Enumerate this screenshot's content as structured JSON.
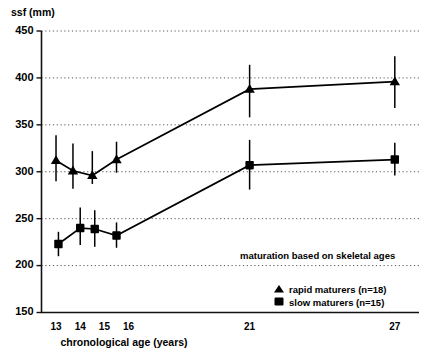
{
  "chart_data": {
    "type": "line",
    "title": "",
    "xlabel": "chronological age (years)",
    "ylabel": "ssf (mm)",
    "xlim": [
      12.4,
      28.0
    ],
    "ylim": [
      150,
      450
    ],
    "yticks": [
      150,
      200,
      250,
      300,
      350,
      400,
      450
    ],
    "xticks": [
      13,
      14,
      15,
      16,
      21,
      27
    ],
    "grid": "horizontal dotted gridlines at each y tick",
    "legend_position": "inside lower-right",
    "annotation": "maturation based on skeletal ages",
    "series": [
      {
        "name": "rapid maturers (n=18)",
        "marker": "triangle",
        "n": 18,
        "x": [
          13.0,
          13.7,
          14.5,
          15.5,
          21.0,
          27.0
        ],
        "values": [
          312,
          301,
          296,
          313,
          388,
          396
        ],
        "err_low": [
          290,
          282,
          287,
          299,
          358,
          368
        ],
        "err_high": [
          339,
          330,
          322,
          332,
          414,
          423
        ]
      },
      {
        "name": "slow maturers (n=15)",
        "marker": "square",
        "n": 15,
        "x": [
          13.1,
          14.0,
          14.6,
          15.5,
          21.0,
          27.0
        ],
        "values": [
          223,
          240,
          239,
          232,
          307,
          313
        ],
        "err_low": [
          210,
          222,
          220,
          219,
          281,
          296
        ],
        "err_high": [
          236,
          262,
          259,
          246,
          334,
          331
        ]
      }
    ]
  },
  "axis": {
    "y_title": "ssf (mm)",
    "x_title": "chronological age (years)",
    "y_tick_labels": [
      "450",
      "400",
      "350",
      "300",
      "250",
      "200",
      "150"
    ],
    "x_tick_labels": [
      "13",
      "14",
      "15",
      "16",
      "21",
      "27"
    ]
  },
  "legend": {
    "note": "maturation based on skeletal ages",
    "items": [
      {
        "label": "rapid maturers (n=18)",
        "marker": "triangle-marker-icon"
      },
      {
        "label": "slow maturers (n=15)",
        "marker": "square-marker-icon"
      }
    ]
  },
  "colors": {
    "ink": "#000000",
    "grid": "#555555",
    "background": "#ffffff"
  }
}
